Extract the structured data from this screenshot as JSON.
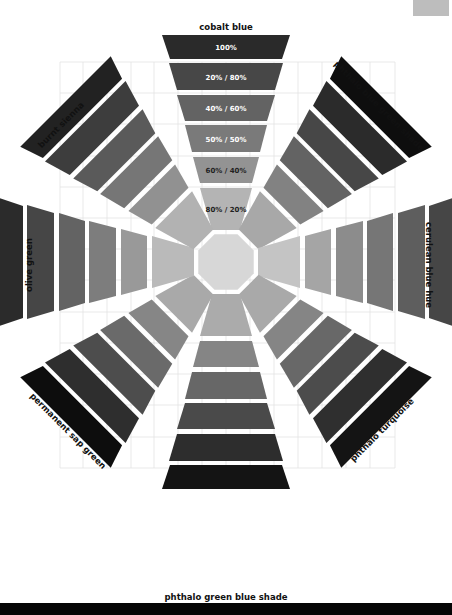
{
  "diagram": {
    "type": "radial color mixing chart",
    "center": {
      "x": 226,
      "y": 262
    },
    "band_labels": [
      "100%",
      "20% / 80%",
      "40% / 60%",
      "50% / 50%",
      "60% / 40%",
      "80% / 20%"
    ],
    "arms": [
      {
        "name": "cobalt blue",
        "angle": 0,
        "shades": [
          "#2a2a2a",
          "#474747",
          "#636363",
          "#7a7a7a",
          "#939393",
          "#b4b4b4"
        ],
        "show_band_labels": true
      },
      {
        "name": "phthalo blue green shade",
        "angle": 45,
        "shades": [
          "#0e0e0e",
          "#2b2b2b",
          "#474747",
          "#636363",
          "#828282",
          "#a8a8a8"
        ],
        "show_band_labels": false
      },
      {
        "name": "cerulean blue hue",
        "angle": 90,
        "shades": [
          "#464646",
          "#5e5e5e",
          "#767676",
          "#8c8c8c",
          "#a5a5a5",
          "#c4c4c4"
        ],
        "show_band_labels": false
      },
      {
        "name": "phthalo turquoise",
        "angle": 135,
        "shades": [
          "#141414",
          "#2f2f2f",
          "#4c4c4c",
          "#686868",
          "#858585",
          "#a9a9a9"
        ],
        "show_band_labels": false
      },
      {
        "name": "phthalo green blue shade",
        "angle": 180,
        "shades": [
          "#141414",
          "#2d2d2d",
          "#4a4a4a",
          "#676767",
          "#858585",
          "#ababab"
        ],
        "show_band_labels": false
      },
      {
        "name": "permanent sap green",
        "angle": 225,
        "shades": [
          "#0d0d0d",
          "#2e2e2e",
          "#4d4d4d",
          "#6a6a6a",
          "#868686",
          "#a9a9a9"
        ],
        "show_band_labels": false
      },
      {
        "name": "olive green",
        "angle": 270,
        "shades": [
          "#2b2b2b",
          "#464646",
          "#636363",
          "#7d7d7d",
          "#999999",
          "#bababa"
        ],
        "show_band_labels": false
      },
      {
        "name": "burnt sienna",
        "angle": 315,
        "shades": [
          "#222222",
          "#3d3d3d",
          "#5a5a5a",
          "#767676",
          "#919191",
          "#b2b2b2"
        ],
        "show_band_labels": false
      }
    ],
    "center_octagon_color": "#d7d7d7",
    "grid_color": "#e3e3e3",
    "footer_bar_color": "#050505",
    "corner_swatch_color": "#bdbdbd"
  }
}
